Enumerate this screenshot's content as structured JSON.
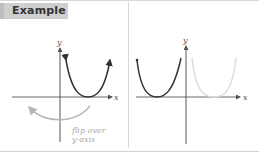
{
  "header": {
    "title": "Example"
  },
  "left_panel": {
    "x_axis_label": "x",
    "y_axis_label": "y",
    "annotation_line1": "flip over",
    "annotation_line2": "y-axis"
  },
  "right_panel": {
    "x_axis_label": "x",
    "y_axis_label": "y"
  },
  "colors": {
    "curve_dark": "#333333",
    "curve_light": "#d8d8d8",
    "arrow_light": "#b5b5b5",
    "header_bg": "#cfcfcf"
  }
}
